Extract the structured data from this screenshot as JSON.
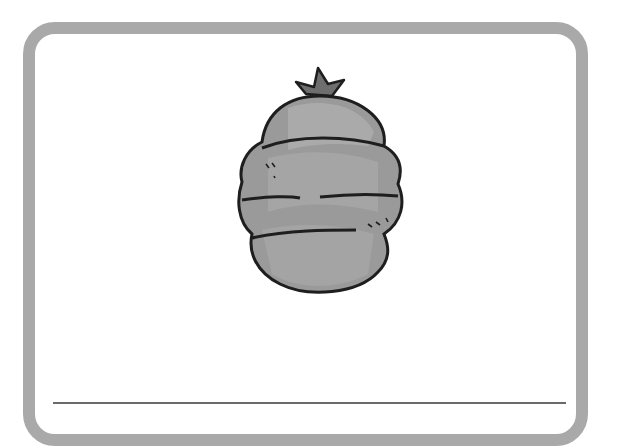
{
  "card": {
    "border_color": "#a9a9a9",
    "background": "#ffffff"
  },
  "illustration": {
    "subject": "garbage-bag",
    "fill_color": "#9e9e9e",
    "outline_color": "#1e1e1e",
    "tie_color": "#6e6e6e"
  },
  "answer_line": {
    "label": "",
    "color": "#6a6a6a"
  }
}
